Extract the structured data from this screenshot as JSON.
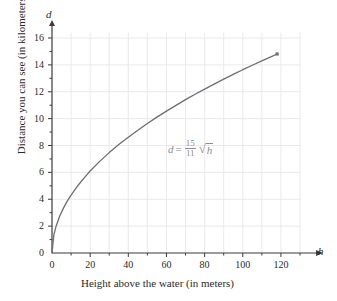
{
  "chart_data": {
    "type": "line",
    "title": "",
    "subtitle": "",
    "xlabel": "Height above the water (in meters)",
    "ylabel": "Distance you can see (in kilometers)",
    "x_axis_variable": "h",
    "y_axis_variable": "d",
    "xlim": [
      0,
      130
    ],
    "ylim": [
      0,
      17
    ],
    "x_ticks": [
      0,
      20,
      40,
      60,
      80,
      100,
      120
    ],
    "y_ticks": [
      0,
      2,
      4,
      6,
      8,
      10,
      12,
      14,
      16
    ],
    "x_tick_labels": [
      "0",
      "20",
      "40",
      "60",
      "80",
      "100",
      "120"
    ],
    "y_tick_labels": [
      "0",
      "2",
      "4",
      "6",
      "8",
      "10",
      "12",
      "14",
      "16"
    ],
    "x_minor_tick_step": 10,
    "y_minor_tick_step": 1,
    "grid": true,
    "grid_x_step": 10,
    "grid_y_step": 2,
    "legend": null,
    "annotations": [
      {
        "name": "curve-equation",
        "text": "d = 15/11 √h",
        "lhs": "d",
        "equals": "=",
        "numerator": "15",
        "denominator": "11",
        "radical_sign": "√",
        "radicand": "h",
        "x": 72,
        "y": 8.0
      }
    ],
    "series": [
      {
        "name": "d = (15/11)√h",
        "formula": "d = (15/11) * sqrt(h)",
        "color": "#6e6e6e",
        "endpoint_marker": true,
        "x": [
          0,
          1,
          2,
          4,
          6,
          8,
          10,
          14,
          18,
          20,
          25,
          30,
          35,
          40,
          45,
          50,
          55,
          60,
          65,
          70,
          75,
          80,
          85,
          90,
          95,
          100,
          105,
          110,
          115,
          118
        ],
        "values": [
          0,
          1.36,
          1.93,
          2.73,
          3.34,
          3.86,
          4.31,
          5.1,
          5.78,
          6.1,
          6.82,
          7.47,
          8.07,
          8.62,
          9.14,
          9.64,
          10.11,
          10.56,
          10.99,
          11.41,
          11.81,
          12.2,
          12.57,
          12.94,
          13.29,
          13.64,
          13.97,
          14.3,
          14.62,
          14.81
        ]
      }
    ]
  },
  "axes": {
    "x_variable_label": "h",
    "y_variable_label": "d"
  },
  "colors": {
    "curve": "#6e6e6e",
    "grid": "#e3e3ea",
    "axis": "#3b3b3b",
    "annotation": "#8d8d8d",
    "background": "#ffffff"
  }
}
